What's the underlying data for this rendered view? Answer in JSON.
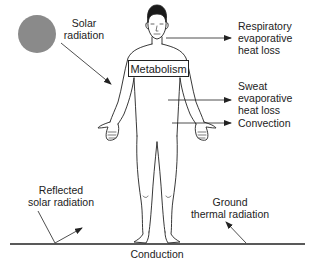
{
  "diagram": {
    "labels": {
      "solar_radiation": [
        "Solar",
        "radiation"
      ],
      "metabolism": "Metabolism",
      "respiratory": [
        "Respiratory",
        "evaporative",
        "heat loss"
      ],
      "sweat": [
        "Sweat",
        "evaporative",
        "heat loss"
      ],
      "convection": "Convection",
      "reflected": [
        "Reflected",
        "solar radiation"
      ],
      "ground_thermal": [
        "Ground",
        "thermal radiation"
      ],
      "conduction": "Conduction"
    },
    "colors": {
      "sun": "#8a8a8a",
      "line": "#222222",
      "background": "#ffffff"
    },
    "arrows": [
      {
        "name": "solar-radiation-arrow",
        "direction": "into body"
      },
      {
        "name": "respiratory-heat-loss-arrow",
        "direction": "out of body"
      },
      {
        "name": "sweat-heat-loss-arrow",
        "direction": "out of body"
      },
      {
        "name": "convection-arrow",
        "direction": "out of body"
      },
      {
        "name": "reflected-solar-arrow",
        "direction": "up from ground"
      },
      {
        "name": "ground-thermal-arrow",
        "direction": "up from ground"
      }
    ],
    "icons": {
      "sun": "sun-icon",
      "figure": "human-figure-icon"
    }
  }
}
